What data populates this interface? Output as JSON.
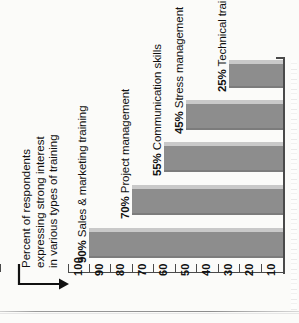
{
  "chart_data": {
    "type": "bar",
    "orientation": "horizontal",
    "title": "Percent of respondents expressing strong interest in various types of training",
    "title_lines": [
      "Percent of respondents",
      "expressing strong interest",
      "in various types of training"
    ],
    "categories": [
      "Sales & marketing training",
      "Project management",
      "Communication skills",
      "Stress management",
      "Technical training"
    ],
    "values": [
      90,
      70,
      55,
      45,
      25
    ],
    "value_labels": [
      "90%",
      "70%",
      "55%",
      "45%",
      "25%"
    ],
    "bar_labels": [
      "90% Sales & marketing training",
      "70% Project management",
      "55% Communication skills",
      "45% Stress management",
      "25% Technical training"
    ],
    "xlabel": "",
    "ylabel": "",
    "axis_ticks": [
      100,
      90,
      80,
      70,
      60,
      50,
      40,
      30,
      20,
      10
    ],
    "axis_tick_labels": [
      "100",
      "90",
      "80",
      "70",
      "60",
      "50",
      "40",
      "30",
      "20",
      "10"
    ],
    "xlim": [
      0,
      100
    ],
    "axis_reversed": true,
    "grid": false,
    "legend": null,
    "colors": {
      "bar_fill": "#8d8d8d",
      "bar_highlight": "#c9c9c9",
      "axis": "#4a4a4a",
      "text": "#101010",
      "background": "#fbfbf9"
    }
  },
  "annotations": {
    "title_pointer": "arrow-from-title-to-axis-origin"
  }
}
